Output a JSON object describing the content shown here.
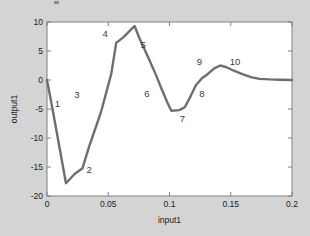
{
  "figure": {
    "background_color": "#d4d4d4",
    "plot_background_color": "#ffffff",
    "axis_color": "#808080",
    "line_color": "#6e6e6e",
    "text_color": "#1a1a1a",
    "label_color": "#3a3a3a"
  },
  "chart_data": {
    "type": "line",
    "title": "",
    "xlabel": "input1",
    "ylabel": "output1",
    "xlim": [
      0,
      0.2
    ],
    "ylim": [
      -20,
      10
    ],
    "xticks": [
      0,
      0.05,
      0.1,
      0.15,
      0.2
    ],
    "xtick_labels": [
      "0",
      "0.05",
      "0.1",
      "0.15",
      "0.2"
    ],
    "yticks": [
      -20,
      -15,
      -10,
      -5,
      0,
      5,
      10
    ],
    "ytick_labels": [
      "-20",
      "-15",
      "-10",
      "-5",
      "0",
      "5",
      "10"
    ],
    "grid": false,
    "legend": false,
    "series": [
      {
        "name": "output1",
        "x": [
          0.0,
          0.0045,
          0.0155,
          0.0225,
          0.029,
          0.0345,
          0.044,
          0.0525,
          0.0565,
          0.0625,
          0.0685,
          0.0715,
          0.0755,
          0.082,
          0.0885,
          0.0935,
          0.0985,
          0.1015,
          0.108,
          0.1125,
          0.1165,
          0.1215,
          0.1265,
          0.1305,
          0.1365,
          0.1415,
          0.1465,
          0.1525,
          0.1595,
          0.1665,
          0.1735,
          0.182,
          0.19,
          0.2
        ],
        "y": [
          0.0,
          -5.0,
          -17.8,
          -16.2,
          -15.2,
          -11.4,
          -5.6,
          1.1,
          6.4,
          7.4,
          8.7,
          9.3,
          7.2,
          4.2,
          1.1,
          -1.5,
          -4.0,
          -5.3,
          -5.2,
          -4.7,
          -3.1,
          -0.9,
          0.3,
          0.9,
          2.0,
          2.5,
          2.2,
          1.6,
          1.0,
          0.5,
          0.2,
          0.1,
          0.05,
          0.0
        ]
      }
    ],
    "point_labels": [
      {
        "text": "1",
        "x": 0.0085,
        "y": -4.6
      },
      {
        "text": "2",
        "x": 0.0345,
        "y": -16.0
      },
      {
        "text": "3",
        "x": 0.0245,
        "y": -3.1
      },
      {
        "text": "4",
        "x": 0.0475,
        "y": 7.5
      },
      {
        "text": "5",
        "x": 0.0785,
        "y": 5.5
      },
      {
        "text": "6",
        "x": 0.0815,
        "y": -3.0
      },
      {
        "text": "7",
        "x": 0.1105,
        "y": -7.3
      },
      {
        "text": "8",
        "x": 0.1265,
        "y": -2.9
      },
      {
        "text": "9",
        "x": 0.1245,
        "y": 2.6
      },
      {
        "text": "10",
        "x": 0.1535,
        "y": 2.6
      }
    ]
  }
}
